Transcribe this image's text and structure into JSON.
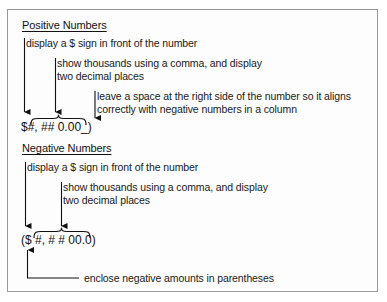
{
  "figure": {
    "title_positive": "Positive Numbers",
    "title_negative": "Negative Numbers",
    "positive": {
      "format": "$#, ## 0.00_)",
      "annotations": [
        "display a $ sign in front of the number",
        "show thousands using a comma, and display",
        "two decimal places",
        "leave a space at the right side of the number so it aligns",
        "correctly with negative numbers in a column"
      ]
    },
    "negative": {
      "format": "($ #, # # 00.0)",
      "annotations": [
        "display a $ sign in front of the number",
        "show thousands using a comma, and display",
        "two decimal places",
        "enclose negative amounts in parentheses"
      ]
    },
    "colors": {
      "ink": "#1a1a1a",
      "border": "#9a9a9a",
      "background": "#fdfdfd"
    }
  }
}
